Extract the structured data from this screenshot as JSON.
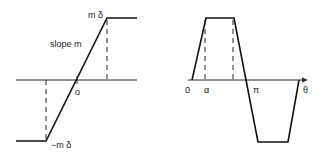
{
  "left_diagram": {
    "description": "Saturation (limiter) characteristic",
    "labels": {
      "upper_level": "m δ",
      "slope": "slope m",
      "origin": "o",
      "lower_level": "−m δ"
    }
  },
  "right_diagram": {
    "description": "Clipped sinusoid output waveform vs angle",
    "labels": {
      "origin": "0",
      "alpha": "α",
      "pi": "π",
      "theta": "θ"
    }
  },
  "colors": {
    "line": "#111111",
    "background": "#ffffff"
  }
}
